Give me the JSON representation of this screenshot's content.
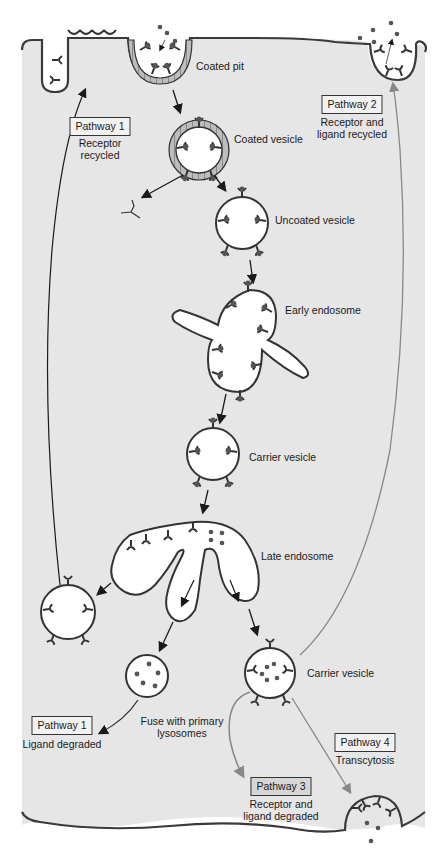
{
  "diagram": {
    "colors": {
      "cytoplasm": "#e6e6e6",
      "membrane": "#3a3a3a",
      "vesicle_fill": "#ffffff",
      "arrow_dark": "#1a1a1a",
      "arrow_gray": "#888888"
    },
    "structures": {
      "coated_pit": "Coated pit",
      "coated_vesicle": "Coated vesicle",
      "uncoated_vesicle": "Uncoated vesicle",
      "early_endosome": "Early endosome",
      "carrier_vesicle_1": "Carrier vesicle",
      "late_endosome": "Late endosome",
      "carrier_vesicle_2": "Carrier vesicle",
      "fuse_lysosomes": "Fuse with primary\nlysosomes"
    },
    "pathways": [
      {
        "id": "pathway-1-top",
        "label": "Pathway 1",
        "desc": "Receptor\nrecycled"
      },
      {
        "id": "pathway-2",
        "label": "Pathway 2",
        "desc": "Receptor and\nligand recycled"
      },
      {
        "id": "pathway-1-bottom",
        "label": "Pathway 1",
        "desc": "Ligand degraded"
      },
      {
        "id": "pathway-4",
        "label": "Pathway 4",
        "desc": "Transcytosis"
      },
      {
        "id": "pathway-3",
        "label": "Pathway 3",
        "desc": "Receptor and\nligand degraded"
      }
    ]
  }
}
